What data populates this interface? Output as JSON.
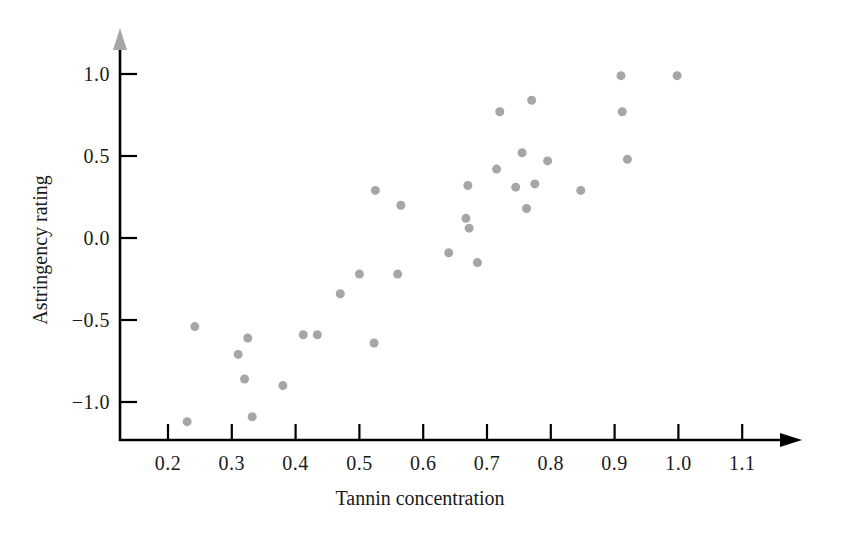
{
  "chart_data": {
    "type": "scatter",
    "title": "",
    "xlabel": "Tannin concentration",
    "ylabel": "Astringency rating",
    "xlim": [
      0.15,
      1.16
    ],
    "ylim": [
      -1.22,
      1.12
    ],
    "xticks": [
      "0.2",
      "0.3",
      "0.4",
      "0.5",
      "0.6",
      "0.7",
      "0.8",
      "0.9",
      "1.0",
      "1.1"
    ],
    "xtick_values": [
      0.2,
      0.3,
      0.4,
      0.5,
      0.6,
      0.7,
      0.8,
      0.9,
      1.0,
      1.1
    ],
    "yticks": [
      "1.0",
      "0.5",
      "0.0",
      "−0.5",
      "−1.0"
    ],
    "ytick_values": [
      1.0,
      0.5,
      0.0,
      -0.5,
      -1.0
    ],
    "grid": false,
    "legend": null,
    "marker_color": "#a6a6a6",
    "marker_size": 9,
    "axis_color": "#000000",
    "x": [
      0.23,
      0.242,
      0.31,
      0.32,
      0.325,
      0.332,
      0.38,
      0.412,
      0.434,
      0.47,
      0.5,
      0.523,
      0.525,
      0.56,
      0.565,
      0.64,
      0.667,
      0.67,
      0.672,
      0.685,
      0.715,
      0.72,
      0.745,
      0.755,
      0.762,
      0.77,
      0.775,
      0.795,
      0.847,
      0.91,
      0.912,
      0.92,
      0.998
    ],
    "y": [
      -1.12,
      -0.54,
      -0.71,
      -0.86,
      -0.61,
      -1.09,
      -0.9,
      -0.59,
      -0.59,
      -0.34,
      -0.22,
      -0.64,
      0.29,
      -0.22,
      0.2,
      -0.09,
      0.12,
      0.32,
      0.06,
      -0.15,
      0.42,
      0.77,
      0.31,
      0.52,
      0.18,
      0.84,
      0.33,
      0.47,
      0.29,
      0.99,
      0.77,
      0.48,
      0.99
    ],
    "points": [
      {
        "x": 0.23,
        "y": -1.12
      },
      {
        "x": 0.242,
        "y": -0.54
      },
      {
        "x": 0.31,
        "y": -0.71
      },
      {
        "x": 0.32,
        "y": -0.86
      },
      {
        "x": 0.325,
        "y": -0.61
      },
      {
        "x": 0.332,
        "y": -1.09
      },
      {
        "x": 0.38,
        "y": -0.9
      },
      {
        "x": 0.412,
        "y": -0.59
      },
      {
        "x": 0.434,
        "y": -0.59
      },
      {
        "x": 0.47,
        "y": -0.34
      },
      {
        "x": 0.5,
        "y": -0.22
      },
      {
        "x": 0.523,
        "y": -0.64
      },
      {
        "x": 0.525,
        "y": 0.29
      },
      {
        "x": 0.56,
        "y": -0.22
      },
      {
        "x": 0.565,
        "y": 0.2
      },
      {
        "x": 0.64,
        "y": -0.09
      },
      {
        "x": 0.667,
        "y": 0.12
      },
      {
        "x": 0.67,
        "y": 0.32
      },
      {
        "x": 0.672,
        "y": 0.06
      },
      {
        "x": 0.685,
        "y": -0.15
      },
      {
        "x": 0.715,
        "y": 0.42
      },
      {
        "x": 0.72,
        "y": 0.77
      },
      {
        "x": 0.745,
        "y": 0.31
      },
      {
        "x": 0.755,
        "y": 0.52
      },
      {
        "x": 0.762,
        "y": 0.18
      },
      {
        "x": 0.77,
        "y": 0.84
      },
      {
        "x": 0.775,
        "y": 0.33
      },
      {
        "x": 0.795,
        "y": 0.47
      },
      {
        "x": 0.847,
        "y": 0.29
      },
      {
        "x": 0.91,
        "y": 0.99
      },
      {
        "x": 0.912,
        "y": 0.77
      },
      {
        "x": 0.92,
        "y": 0.48
      },
      {
        "x": 0.998,
        "y": 0.99
      }
    ]
  }
}
